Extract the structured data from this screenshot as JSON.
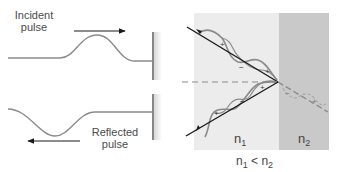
{
  "left_panel": {
    "incident_label_line1": "Incident",
    "incident_label_line2": "pulse",
    "reflected_label_line1": "Reflected",
    "reflected_label_line2": "pulse",
    "incident_arrow_direction": "right",
    "reflected_arrow_direction": "left"
  },
  "right_panel": {
    "medium1_label": "n",
    "medium1_sub": "1",
    "medium2_label": "n",
    "medium2_sub": "2",
    "condition": {
      "a": "n",
      "a_sub": "1",
      "op": "<",
      "b": "n",
      "b_sub": "2"
    },
    "incident_wave_signs": [
      "+",
      "−",
      "+"
    ],
    "reflected_wave_signs": [
      "+",
      "−",
      "+"
    ],
    "transmitted_wave_signs": [
      "−",
      "+"
    ]
  },
  "colors": {
    "medium1_fill": "#ececec",
    "medium2_fill": "#c9c9c9",
    "ray": "#1a1a1a",
    "wave": "#8a8a8a",
    "normal_dashed": "#8a8a8a",
    "transmitted": "#9a9a9a",
    "wall": "#555555",
    "wall_shadow": "#dcdcdc"
  }
}
